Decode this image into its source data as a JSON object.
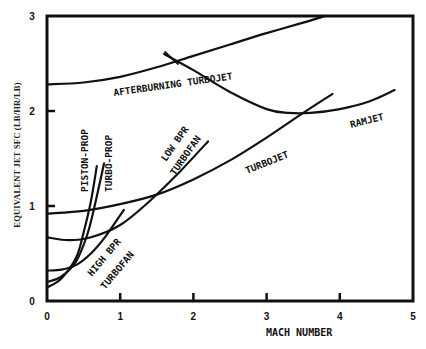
{
  "chart_data": {
    "type": "line",
    "title": "",
    "xlabel": "MACH NUMBER",
    "ylabel": "EQUIVALENT JET SFC (LB/HR/LB)",
    "xlim": [
      0,
      5
    ],
    "ylim": [
      0,
      3
    ],
    "xticks": [
      "0",
      "1",
      "2",
      "3",
      "4",
      "5"
    ],
    "yticks": [
      "0",
      "1",
      "2",
      "3"
    ],
    "grid": false,
    "legend": "none (curves labeled inline)",
    "series": [
      {
        "name": "AFTERBURNING TURBOJET",
        "x": [
          0,
          0.5,
          1,
          1.5,
          2,
          2.5,
          3,
          3.5,
          3.8
        ],
        "y": [
          2.28,
          2.3,
          2.36,
          2.46,
          2.58,
          2.7,
          2.82,
          2.93,
          3.0
        ]
      },
      {
        "name": "RAMJET",
        "x": [
          1.6,
          2,
          2.5,
          3,
          3.3,
          3.6,
          4,
          4.4,
          4.75
        ],
        "y": [
          2.6,
          2.43,
          2.2,
          2.02,
          1.98,
          1.98,
          2.02,
          2.1,
          2.22
        ]
      },
      {
        "name": "TURBOJET",
        "x": [
          0,
          0.5,
          1,
          1.5,
          2,
          2.5,
          3,
          3.5,
          3.9
        ],
        "y": [
          0.92,
          0.95,
          1.02,
          1.12,
          1.28,
          1.48,
          1.72,
          1.98,
          2.18
        ]
      },
      {
        "name": "LOW BPR TURBOFAN",
        "x": [
          0,
          0.3,
          0.6,
          1,
          1.4,
          1.8,
          2.2
        ],
        "y": [
          0.67,
          0.64,
          0.67,
          0.8,
          1.05,
          1.35,
          1.68
        ]
      },
      {
        "name": "HIGH BPR TURBOFAN",
        "x": [
          0,
          0.2,
          0.4,
          0.6,
          0.8,
          1.05
        ],
        "y": [
          0.32,
          0.33,
          0.38,
          0.5,
          0.68,
          0.96
        ]
      },
      {
        "name": "PISTON-PROP",
        "x": [
          0,
          0.2,
          0.4,
          0.5,
          0.6,
          0.68
        ],
        "y": [
          0.14,
          0.24,
          0.46,
          0.72,
          1.05,
          1.42
        ]
      },
      {
        "name": "TURBO-PROP",
        "x": [
          0,
          0.2,
          0.4,
          0.55,
          0.65,
          0.78
        ],
        "y": [
          0.2,
          0.26,
          0.42,
          0.7,
          1.0,
          1.45
        ]
      }
    ],
    "annotations": [
      "AFTERBURNING TURBOJET",
      "RAMJET",
      "TURBOJET",
      "LOW BPR TURBOFAN",
      "HIGH BPR TURBOFAN",
      "PISTON-PROP",
      "TURBO-PROP"
    ]
  },
  "labels": {
    "ab_turbojet": "AFTERBURNING TURBOJET",
    "ramjet": "RAMJET",
    "turbojet": "TURBOJET",
    "low_bpr_1": "LOW BPR",
    "low_bpr_2": "TURBOFAN",
    "high_bpr_1": "HIGH BPR",
    "high_bpr_2": "TURBOFAN",
    "piston": "PISTON-PROP",
    "turboprop": "TURBO-PROP"
  },
  "style": {
    "line_color": "#111111",
    "background": "#ffffff"
  }
}
